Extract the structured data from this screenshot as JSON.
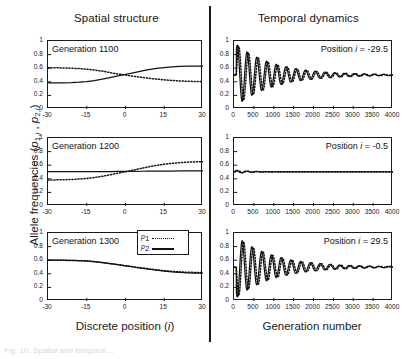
{
  "figure": {
    "column_titles": {
      "left": "Spatial structure",
      "right": "Temporal dynamics"
    },
    "y_axis_label_prefix": "Allele frequencies (",
    "y_axis_label_suffix": ")",
    "x_axis_label_left": "Discrete position (",
    "x_axis_label_left_suffix": ")",
    "x_axis_label_right": "Generation number",
    "x_var_left": "i",
    "caption": "Fig. 10.  Spatial and temporal ..."
  },
  "legend": {
    "series": [
      {
        "key": "p",
        "subscript": "1",
        "style": "dotted"
      },
      {
        "key": "p",
        "subscript": "2",
        "style": "solid"
      }
    ]
  },
  "chart_data": [
    {
      "type": "line",
      "panel_id": "spatial-gen-1100",
      "title": "Generation 1100",
      "xlabel": "Discrete position (i)",
      "ylabel": "Allele frequencies (p1,i , p2,i)",
      "xlim": [
        -30,
        30
      ],
      "ylim": [
        0,
        1
      ],
      "xticks": [
        -30,
        -15,
        0,
        15,
        30
      ],
      "yticks": [
        0,
        0.2,
        0.4,
        0.6,
        0.8,
        1
      ],
      "grid": false,
      "legend_position": "none",
      "x": [
        -30,
        -27,
        -24,
        -21,
        -18,
        -15,
        -12,
        -9,
        -6,
        -3,
        0,
        3,
        6,
        9,
        12,
        15,
        18,
        21,
        24,
        27,
        30
      ],
      "series": [
        {
          "name": "p1",
          "style": "dotted",
          "values": [
            0.607,
            0.606,
            0.604,
            0.6,
            0.594,
            0.586,
            0.573,
            0.557,
            0.536,
            0.515,
            0.5,
            0.482,
            0.466,
            0.452,
            0.44,
            0.429,
            0.42,
            0.413,
            0.408,
            0.405,
            0.403
          ]
        },
        {
          "name": "p2",
          "style": "solid",
          "values": [
            0.384,
            0.384,
            0.385,
            0.388,
            0.394,
            0.404,
            0.419,
            0.439,
            0.463,
            0.487,
            0.508,
            0.532,
            0.556,
            0.578,
            0.596,
            0.61,
            0.62,
            0.626,
            0.629,
            0.63,
            0.63
          ]
        }
      ]
    },
    {
      "type": "line",
      "panel_id": "spatial-gen-1200",
      "title": "Generation 1200",
      "xlabel": "Discrete position (i)",
      "ylabel": "Allele frequencies (p1,i , p2,i)",
      "xlim": [
        -30,
        30
      ],
      "ylim": [
        0,
        1
      ],
      "xticks": [
        -30,
        -15,
        0,
        15,
        30
      ],
      "yticks": [
        0,
        0.2,
        0.4,
        0.6,
        0.8,
        1
      ],
      "grid": false,
      "legend_position": "none",
      "x": [
        -30,
        -27,
        -24,
        -21,
        -18,
        -15,
        -12,
        -9,
        -6,
        -3,
        0,
        3,
        6,
        9,
        12,
        15,
        18,
        21,
        24,
        27,
        30
      ],
      "series": [
        {
          "name": "p1",
          "style": "dotted",
          "values": [
            0.383,
            0.384,
            0.386,
            0.39,
            0.396,
            0.405,
            0.419,
            0.437,
            0.459,
            0.482,
            0.503,
            0.528,
            0.553,
            0.576,
            0.597,
            0.614,
            0.628,
            0.638,
            0.645,
            0.649,
            0.651
          ]
        },
        {
          "name": "p2",
          "style": "solid",
          "values": [
            0.507,
            0.507,
            0.507,
            0.507,
            0.507,
            0.507,
            0.507,
            0.507,
            0.507,
            0.508,
            0.509,
            0.51,
            0.511,
            0.512,
            0.513,
            0.514,
            0.514,
            0.515,
            0.515,
            0.516,
            0.516
          ]
        }
      ]
    },
    {
      "type": "line",
      "panel_id": "spatial-gen-1300",
      "title": "Generation 1300",
      "xlabel": "Discrete position (i)",
      "ylabel": "Allele frequencies (p1,i , p2,i)",
      "xlim": [
        -30,
        30
      ],
      "ylim": [
        0,
        1
      ],
      "xticks": [
        -30,
        -15,
        0,
        15,
        30
      ],
      "yticks": [
        0,
        0.2,
        0.4,
        0.6,
        0.8,
        1
      ],
      "grid": false,
      "legend_position": "top-right",
      "x": [
        -30,
        -27,
        -24,
        -21,
        -18,
        -15,
        -12,
        -9,
        -6,
        -3,
        0,
        3,
        6,
        9,
        12,
        15,
        18,
        21,
        24,
        27,
        30
      ],
      "series": [
        {
          "name": "p1",
          "style": "dotted",
          "values": [
            0.601,
            0.6,
            0.598,
            0.596,
            0.593,
            0.588,
            0.578,
            0.566,
            0.551,
            0.535,
            0.52,
            0.503,
            0.487,
            0.472,
            0.458,
            0.446,
            0.436,
            0.428,
            0.423,
            0.42,
            0.419
          ]
        },
        {
          "name": "p2",
          "style": "solid",
          "values": [
            0.603,
            0.602,
            0.6,
            0.598,
            0.594,
            0.589,
            0.579,
            0.566,
            0.55,
            0.534,
            0.518,
            0.5,
            0.483,
            0.468,
            0.453,
            0.441,
            0.43,
            0.422,
            0.415,
            0.411,
            0.409
          ]
        }
      ]
    },
    {
      "type": "line",
      "panel_id": "temporal-pos-minus29p5",
      "title": "Position i = -29.5",
      "position_label_prefix": "Position ",
      "position_var": "i",
      "position_value": "= -29.5",
      "xlabel": "Generation number",
      "ylabel": "Allele frequencies (p1,i , p2,i)",
      "xlim": [
        0,
        4000
      ],
      "ylim": [
        0,
        1
      ],
      "xticks": [
        0,
        500,
        1000,
        1500,
        2000,
        2500,
        3000,
        3500,
        4000
      ],
      "yticks": [
        0,
        0.2,
        0.4,
        0.6,
        0.8,
        1
      ],
      "grid": false,
      "legend_position": "none",
      "oscillation": {
        "start_amplitude": 0.45,
        "decay_generations": 950,
        "period_generations": 245,
        "equilibrium": 0.5,
        "p1_phase_deg": 0,
        "p2_phase_deg": 55,
        "start_generation": 60
      }
    },
    {
      "type": "line",
      "panel_id": "temporal-pos-minus0p5",
      "title": "Position i = -0.5",
      "position_label_prefix": "Position ",
      "position_var": "i",
      "position_value": "= -0.5",
      "xlabel": "Generation number",
      "ylabel": "Allele frequencies (p1,i , p2,i)",
      "xlim": [
        0,
        4000
      ],
      "ylim": [
        0,
        1
      ],
      "xticks": [
        0,
        500,
        1000,
        1500,
        2000,
        2500,
        3000,
        3500,
        4000
      ],
      "yticks": [
        0,
        0.2,
        0.4,
        0.6,
        0.8,
        1
      ],
      "grid": false,
      "legend_position": "none",
      "oscillation": {
        "start_amplitude": 0.022,
        "decay_generations": 330,
        "period_generations": 245,
        "equilibrium": 0.503,
        "p1_phase_deg": 0,
        "p2_phase_deg": 55,
        "start_generation": 40
      }
    },
    {
      "type": "line",
      "panel_id": "temporal-pos-29p5",
      "title": "Position i = 29.5",
      "position_label_prefix": "Position ",
      "position_var": "i",
      "position_value": "= 29.5",
      "xlabel": "Generation number",
      "ylabel": "Allele frequencies (p1,i , p2,i)",
      "xlim": [
        0,
        4000
      ],
      "ylim": [
        0,
        1
      ],
      "xticks": [
        0,
        500,
        1000,
        1500,
        2000,
        2500,
        3000,
        3500,
        4000
      ],
      "yticks": [
        0,
        0.2,
        0.4,
        0.6,
        0.8,
        1
      ],
      "grid": false,
      "legend_position": "none",
      "oscillation": {
        "start_amplitude": 0.45,
        "decay_generations": 950,
        "period_generations": 245,
        "equilibrium": 0.5,
        "p1_phase_deg": 180,
        "p2_phase_deg": 235,
        "start_generation": 60
      }
    }
  ]
}
